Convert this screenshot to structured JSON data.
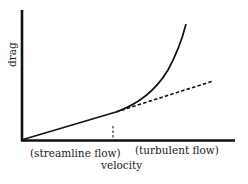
{
  "diagram": {
    "y_axis_label": "drag",
    "x_axis_label": "velocity",
    "region_labels": {
      "left": "(streamline flow)",
      "right": "(turbulent flow)"
    },
    "colors": {
      "line": "#111111",
      "background": "#ffffff"
    },
    "curves": {
      "linear_region": "straight line from origin to transition point",
      "turbulent_curve": "solid curve rising steeply after transition",
      "extrapolated_linear": "dashed continuation of linear trend",
      "transition_marker": "short dashed vertical line at transition velocity"
    }
  }
}
